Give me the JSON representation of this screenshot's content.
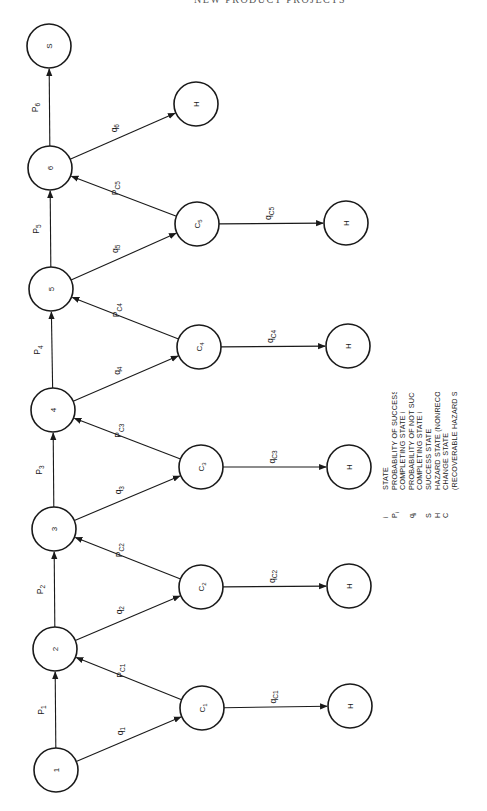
{
  "header": {
    "text": "NEW PRODUCT PROJECTS"
  },
  "diagram": {
    "orientation": "rotated -90deg",
    "nodes": [
      {
        "id": "1",
        "label": "1",
        "type": "state",
        "x": 56,
        "y": 770
      },
      {
        "id": "2",
        "label": "2",
        "type": "state",
        "x": 55,
        "y": 649
      },
      {
        "id": "3",
        "label": "3",
        "type": "state",
        "x": 54,
        "y": 529
      },
      {
        "id": "4",
        "label": "4",
        "type": "state",
        "x": 53,
        "y": 410
      },
      {
        "id": "5",
        "label": "5",
        "type": "state",
        "x": 51,
        "y": 289
      },
      {
        "id": "6",
        "label": "6",
        "type": "state",
        "x": 50,
        "y": 168
      },
      {
        "id": "S",
        "label": "S",
        "type": "success",
        "x": 49,
        "y": 46
      },
      {
        "id": "C1",
        "label": "C",
        "sub": "1",
        "type": "change",
        "x": 202,
        "y": 708
      },
      {
        "id": "C2",
        "label": "C",
        "sub": "2",
        "type": "change",
        "x": 201,
        "y": 587
      },
      {
        "id": "C3",
        "label": "C",
        "sub": "3",
        "type": "change",
        "x": 201,
        "y": 467
      },
      {
        "id": "C4",
        "label": "C",
        "sub": "4",
        "type": "change",
        "x": 199,
        "y": 347
      },
      {
        "id": "C5",
        "label": "C",
        "sub": "5",
        "type": "change",
        "x": 197,
        "y": 224
      },
      {
        "id": "H1",
        "label": "H",
        "type": "hazard",
        "x": 350,
        "y": 706
      },
      {
        "id": "H2",
        "label": "H",
        "type": "hazard",
        "x": 349,
        "y": 586
      },
      {
        "id": "H3",
        "label": "H",
        "type": "hazard",
        "x": 349,
        "y": 467
      },
      {
        "id": "H4",
        "label": "H",
        "type": "hazard",
        "x": 348,
        "y": 346
      },
      {
        "id": "H5",
        "label": "H",
        "type": "hazard",
        "x": 346,
        "y": 223
      },
      {
        "id": "H6",
        "label": "H",
        "type": "hazard",
        "x": 196,
        "y": 104
      }
    ],
    "edges": [
      {
        "from": "1",
        "to": "2",
        "label": "P",
        "sub": "1"
      },
      {
        "from": "2",
        "to": "3",
        "label": "P",
        "sub": "2"
      },
      {
        "from": "3",
        "to": "4",
        "label": "P",
        "sub": "3"
      },
      {
        "from": "4",
        "to": "5",
        "label": "P",
        "sub": "4"
      },
      {
        "from": "5",
        "to": "6",
        "label": "P",
        "sub": "5"
      },
      {
        "from": "6",
        "to": "S",
        "label": "P",
        "sub": "6"
      },
      {
        "from": "1",
        "to": "C1",
        "label": "q",
        "sub": "1"
      },
      {
        "from": "2",
        "to": "C2",
        "label": "q",
        "sub": "2"
      },
      {
        "from": "3",
        "to": "C3",
        "label": "q",
        "sub": "3"
      },
      {
        "from": "4",
        "to": "C4",
        "label": "q",
        "sub": "4"
      },
      {
        "from": "5",
        "to": "C5",
        "label": "q",
        "sub": "5"
      },
      {
        "from": "6",
        "to": "H6",
        "label": "q",
        "sub": "6"
      },
      {
        "from": "C1",
        "to": "2",
        "label": "P",
        "sub": "C1"
      },
      {
        "from": "C2",
        "to": "3",
        "label": "P",
        "sub": "C2"
      },
      {
        "from": "C3",
        "to": "4",
        "label": "P",
        "sub": "C3"
      },
      {
        "from": "C4",
        "to": "5",
        "label": "P",
        "sub": "C4"
      },
      {
        "from": "C5",
        "to": "6",
        "label": "P",
        "sub": "C5"
      },
      {
        "from": "C1",
        "to": "H1",
        "label": "q",
        "sub": "C1"
      },
      {
        "from": "C2",
        "to": "H2",
        "label": "q",
        "sub": "C2"
      },
      {
        "from": "C3",
        "to": "H3",
        "label": "q",
        "sub": "C3"
      },
      {
        "from": "C4",
        "to": "H4",
        "label": "q",
        "sub": "C4"
      },
      {
        "from": "C5",
        "to": "H5",
        "label": "q",
        "sub": "C5"
      }
    ]
  },
  "legend": {
    "items": [
      {
        "symbol": "i",
        "lines": [
          "STATE"
        ]
      },
      {
        "symbol": "Pi",
        "lines": [
          "PROBABILITY OF SUCCESSFULLY",
          "COMPLETING STATE i"
        ]
      },
      {
        "symbol": "qi",
        "lines": [
          "PROBABILITY OF NOT SUCCESSFULLY",
          "COMPLETING STATE i"
        ]
      },
      {
        "symbol": "S",
        "lines": [
          "SUCCESS STATE"
        ]
      },
      {
        "symbol": "H",
        "lines": [
          "HAZARD STATE (NONRECOVERABLE)"
        ]
      },
      {
        "symbol": "C",
        "lines": [
          "CHANGE STATE",
          "(RECOVERABLE HAZARD STATE)"
        ]
      }
    ]
  }
}
